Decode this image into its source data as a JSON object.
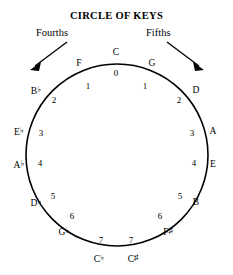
{
  "title": "CIRCLE OF KEYS",
  "directions": {
    "left": {
      "label": "Fourths",
      "icon": "arrow-down-left-icon"
    },
    "right": {
      "label": "Fifths",
      "icon": "arrow-down-right-icon"
    }
  },
  "colors": {
    "stroke": "#000000",
    "background": "#ffffff",
    "text": "#000000"
  },
  "chart_data": {
    "type": "diagram",
    "title": "CIRCLE OF KEYS",
    "shape": "circle",
    "nodes": [
      {
        "key": "C",
        "accidental": "",
        "count": "0",
        "angle_deg": 0
      },
      {
        "key": "G",
        "accidental": "",
        "count": "1",
        "angle_deg": 30
      },
      {
        "key": "D",
        "accidental": "",
        "count": "2",
        "angle_deg": 60
      },
      {
        "key": "A",
        "accidental": "",
        "count": "3",
        "angle_deg": 90
      },
      {
        "key": "E",
        "accidental": "",
        "count": "4",
        "angle_deg": 120
      },
      {
        "key": "B",
        "accidental": "",
        "count": "5",
        "angle_deg": 150
      },
      {
        "key": "F",
        "accidental": "♯",
        "count": "6",
        "angle_deg": 175
      },
      {
        "key": "C",
        "accidental": "♯",
        "count": "7",
        "angle_deg": 193
      },
      {
        "key": "C",
        "accidental": "♭",
        "count": "7",
        "angle_deg": 167
      },
      {
        "key": "G",
        "accidental": "♭",
        "count": "6",
        "angle_deg": 185
      },
      {
        "key": "D",
        "accidental": "♭",
        "count": "5",
        "angle_deg": 210
      },
      {
        "key": "A",
        "accidental": "♭",
        "count": "4",
        "angle_deg": 240
      },
      {
        "key": "E",
        "accidental": "♭",
        "count": "3",
        "angle_deg": 270
      },
      {
        "key": "B",
        "accidental": "♭",
        "count": "2",
        "angle_deg": 300
      },
      {
        "key": "F",
        "accidental": "",
        "count": "1",
        "angle_deg": 330
      }
    ]
  },
  "nodes_right": [
    {
      "name": "node-g",
      "key": "G",
      "acc": "",
      "count": "1",
      "label_x": 152,
      "label_y": 64,
      "count_x": 145,
      "count_y": 86
    },
    {
      "name": "node-d",
      "key": "D",
      "acc": "",
      "count": "2",
      "label_x": 196,
      "label_y": 91,
      "count_x": 179,
      "count_y": 100
    },
    {
      "name": "node-a",
      "key": "A",
      "acc": "",
      "count": "3",
      "label_x": 213,
      "label_y": 132,
      "count_x": 192,
      "count_y": 133
    },
    {
      "name": "node-e",
      "key": "E",
      "acc": "",
      "count": "4",
      "label_x": 213,
      "label_y": 165,
      "count_x": 194,
      "count_y": 163
    },
    {
      "name": "node-b",
      "key": "B",
      "acc": "",
      "count": "5",
      "label_x": 196,
      "label_y": 203,
      "count_x": 180,
      "count_y": 196
    },
    {
      "name": "node-f-sharp",
      "key": "F",
      "acc": "♯",
      "count": "6",
      "label_x": 168,
      "label_y": 232,
      "count_x": 160,
      "count_y": 216
    },
    {
      "name": "node-c-sharp",
      "key": "C",
      "acc": "♯",
      "count": "7",
      "label_x": 133,
      "label_y": 259,
      "count_x": 131,
      "count_y": 240
    }
  ],
  "nodes_left": [
    {
      "name": "node-f",
      "key": "F",
      "acc": "",
      "count": "1",
      "label_x": 79,
      "label_y": 64,
      "count_x": 88,
      "count_y": 86
    },
    {
      "name": "node-b-flat",
      "key": "B",
      "acc": "♭",
      "count": "2",
      "label_x": 36,
      "label_y": 91,
      "count_x": 54,
      "count_y": 100
    },
    {
      "name": "node-e-flat",
      "key": "E",
      "acc": "♭",
      "count": "3",
      "label_x": 19,
      "label_y": 132,
      "count_x": 41,
      "count_y": 133
    },
    {
      "name": "node-a-flat",
      "key": "A",
      "acc": "♭",
      "count": "4",
      "label_x": 19,
      "label_y": 165,
      "count_x": 40,
      "count_y": 163
    },
    {
      "name": "node-d-flat",
      "key": "D",
      "acc": "♭",
      "count": "5",
      "label_x": 36,
      "label_y": 203,
      "count_x": 53,
      "count_y": 196
    },
    {
      "name": "node-g-flat",
      "key": "G",
      "acc": "♭",
      "count": "6",
      "label_x": 64,
      "label_y": 232,
      "count_x": 72,
      "count_y": 216
    },
    {
      "name": "node-c-flat",
      "key": "C",
      "acc": "♭",
      "count": "7",
      "label_x": 99,
      "label_y": 259,
      "count_x": 101,
      "count_y": 240
    }
  ],
  "node_top": {
    "name": "node-c",
    "key": "C",
    "acc": "",
    "count": "0",
    "label_x": 116,
    "label_y": 53,
    "count_x": 116,
    "count_y": 73
  }
}
